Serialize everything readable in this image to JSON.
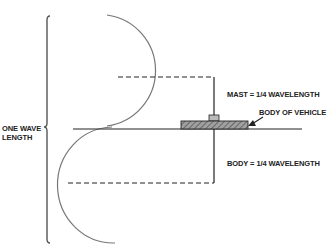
{
  "diagram": {
    "labels": {
      "mast": "MAST = 1/4 WAVELENGTH",
      "body_of_vehicle": "BODY OF VEHICLE",
      "body": "BODY = 1/4 WAVELENGTH",
      "one_wave_line1": "ONE WAVE",
      "one_wave_line2": "LENGTH"
    },
    "colors": {
      "line": "#222222",
      "curve": "#777777",
      "hatch_fill": "#999999"
    }
  }
}
